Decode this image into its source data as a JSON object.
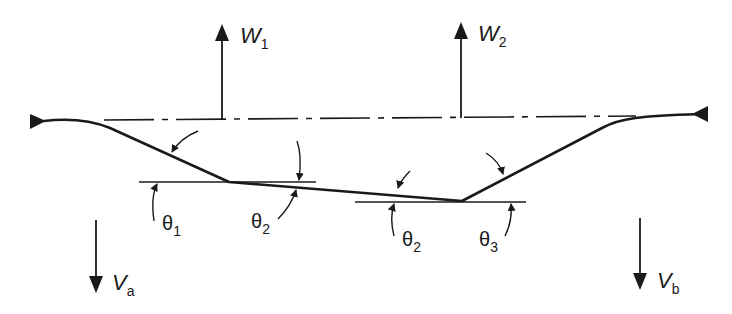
{
  "diagram": {
    "colors": {
      "ink": "#1a1a1a",
      "background": "#ffffff"
    },
    "loads": [
      {
        "id": "W1",
        "symbol": "W",
        "subscript": "1",
        "direction": "up"
      },
      {
        "id": "W2",
        "symbol": "W",
        "subscript": "2",
        "direction": "up"
      }
    ],
    "reactions": [
      {
        "id": "Va",
        "symbol": "V",
        "subscript": "a",
        "direction": "down"
      },
      {
        "id": "Vb",
        "symbol": "V",
        "subscript": "b",
        "direction": "down"
      }
    ],
    "angles": [
      {
        "id": "theta1_left",
        "symbol": "θ",
        "subscript": "1"
      },
      {
        "id": "theta2_left",
        "symbol": "θ",
        "subscript": "2"
      },
      {
        "id": "theta2_right",
        "symbol": "θ",
        "subscript": "2"
      },
      {
        "id": "theta3",
        "symbol": "θ",
        "subscript": "3"
      }
    ],
    "reference_line": "dash-dot horizontal chord line",
    "supports": [
      "left-pin-triangle",
      "right-pin-triangle"
    ]
  }
}
